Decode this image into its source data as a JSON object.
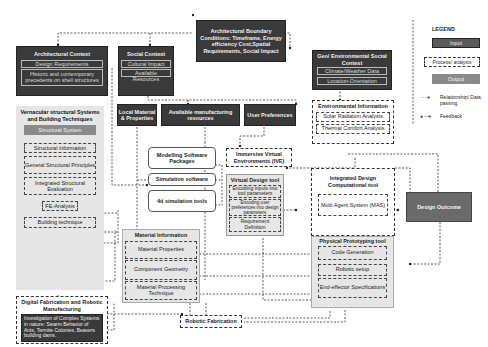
{
  "legend": {
    "title": "LEGEND",
    "input": "Input",
    "process": "Process/ analysis",
    "output": "Output",
    "relationship": "Relationship/ Data passing",
    "feedback": "Feedback"
  },
  "boundary": {
    "title": "Architectural Boundary Conditions: Timeframe, Energy efficiency Cost,Spatial Requirements, Social Impact"
  },
  "arch_context": {
    "title": "Architectural Context",
    "items": [
      "Design Requirements",
      "Historic and contemporary precedents on shell structures"
    ]
  },
  "social_context": {
    "title": "Social Context",
    "items": [
      "Cultural Impact",
      "Available Resources"
    ]
  },
  "geo_context": {
    "title": "Geo/ Environmental Social Context",
    "items": [
      "Climate/Weather Data",
      "Location-Orientation"
    ]
  },
  "vernacular": {
    "title": "Vernacular structural Systems and Building Techniques",
    "structural_system": "Structural System",
    "items": [
      "Structural information",
      "General Structural Principles",
      "Integrated Structural Evaluation",
      "FE-Analysis",
      "Building technique"
    ]
  },
  "digital_fab": {
    "title": "Digital Fabrication and Robotic Manufacturing",
    "body": "Investigation of Complex Systems in nature: Swarm Behavior of Ants, Termite Colonies, Beavers building dams."
  },
  "inputs_row": {
    "local_material": "Local Material & Properties",
    "manufacturing": "Available manufacturing resources",
    "user_pref": "User Preferences"
  },
  "environmental": {
    "title": "Environmental Information",
    "items": [
      "Solar Radiation Analysis",
      "Thermal Comfort Analysis"
    ]
  },
  "software": {
    "items": [
      "Modelling Software Packages",
      "Simulation software",
      "4d simulation tools"
    ]
  },
  "ive": {
    "title": "Immersive Virtual Environments (IVE)"
  },
  "virtual_tool": {
    "title": "Virtual Design tool",
    "items": [
      "Encoding inputs into tool parameters",
      "Encoding user preferences into design parameters",
      "Requirement Definition"
    ]
  },
  "integrated_tool": {
    "title": "Integrated Design Computational tool",
    "mas": "Multi Agent System (MAS)"
  },
  "design_outcome": {
    "title": "Design Outcome"
  },
  "material_info": {
    "title": "Material Information",
    "items": [
      "Material Properties",
      "Component Geometry",
      "Material Processing Technique"
    ]
  },
  "physical_tool": {
    "title": "Physical Prototyping tool",
    "items": [
      "Code Generation",
      "Robotic setup",
      "End-effector Specifications"
    ]
  },
  "robotic_fab": {
    "title": "Robotic Fabrication"
  }
}
